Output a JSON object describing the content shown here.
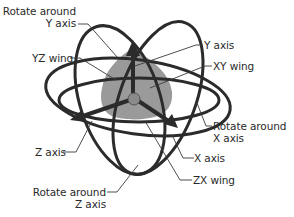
{
  "diagram": {
    "type": "3D rotation gizmo",
    "colors": {
      "ring": "#2b2b2b",
      "wing_fill": "#9a9a9a",
      "leader": "#3a3a3a",
      "text": "#2a2a2a",
      "background": "#ffffff"
    },
    "labels": {
      "rotate_y": [
        "Rotate around",
        "Y axis"
      ],
      "yz_wing": "YZ wing",
      "y_axis": "Y axis",
      "xy_wing": "XY wing",
      "rotate_x": [
        "Rotate around",
        "X axis"
      ],
      "x_axis": "X axis",
      "z_axis": "Z axis",
      "zx_wing": "ZX wing",
      "rotate_z": [
        "Rotate around",
        "Z axis"
      ]
    }
  }
}
